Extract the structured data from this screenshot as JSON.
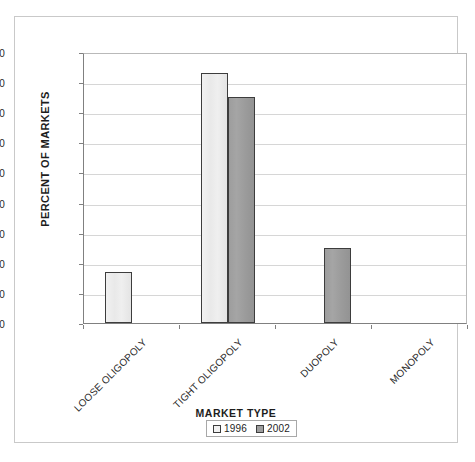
{
  "chart_data": {
    "type": "bar",
    "title": "",
    "subtitle": "",
    "categories": [
      "LOOSE OLIGOPOLY",
      "TIGHT OLIGOPOLY",
      "DUOPOLY",
      "MONOPOLY"
    ],
    "series": [
      {
        "name": "1996",
        "values": [
          17,
          83,
          0,
          0
        ],
        "color": "#f2f2f2"
      },
      {
        "name": "2002",
        "values": [
          0,
          75,
          25,
          0
        ],
        "color": "#9e9e9e"
      }
    ],
    "xlabel": "MARKET TYPE",
    "ylabel": "PERCENT OF MARKETS",
    "ylim": [
      0,
      90
    ],
    "ytick_step": 10,
    "yticks": [
      0,
      10,
      20,
      30,
      40,
      50,
      60,
      70,
      80,
      90
    ],
    "ytick_labels": [
      "0",
      "10",
      "20",
      "30",
      "40",
      "50",
      "60",
      "70",
      "80",
      "90"
    ],
    "grid": "horizontal",
    "legend_position": "bottom",
    "xtick_label_rotation": -45
  },
  "legend": {
    "entries": [
      {
        "label": "1996"
      },
      {
        "label": "2002"
      }
    ]
  },
  "colors": {
    "series_1996": "#f2f2f2",
    "series_2002": "#9e9e9e",
    "bar_border": "#3d3d3d",
    "gridline": "#d6d6d6",
    "axis": "#808080",
    "frame": "#c9c9c9",
    "text": "#1d1d1d",
    "background": "#ffffff"
  }
}
